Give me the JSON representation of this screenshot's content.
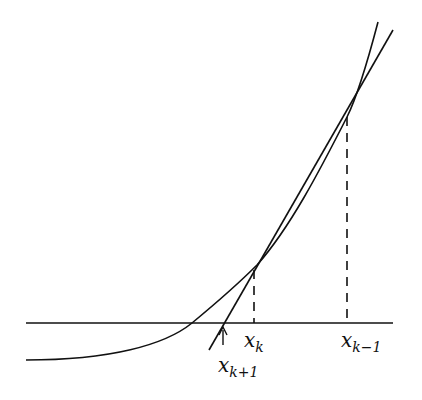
{
  "diagram": {
    "labels": {
      "xk": {
        "base": "x",
        "sub": "k"
      },
      "xk_minus_1": {
        "base": "x",
        "sub": "k−1"
      },
      "xk_plus_1": {
        "base": "x",
        "sub": "k+1"
      }
    },
    "elements": [
      "x-axis",
      "function-curve",
      "secant-line",
      "dashed-guide-xk",
      "dashed-guide-xk-1",
      "arrow-xk+1"
    ],
    "colors": {
      "stroke": "#111111",
      "background": "#ffffff"
    }
  }
}
